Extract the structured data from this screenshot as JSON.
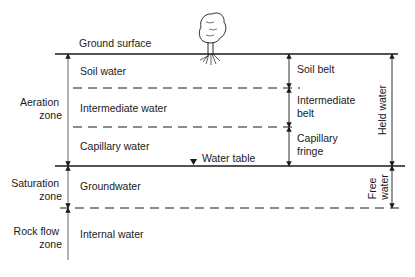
{
  "diagram": {
    "ground_surface": "Ground surface",
    "water_table": "Water table",
    "water_types": [
      {
        "label": "Soil water"
      },
      {
        "label": "Intermediate water"
      },
      {
        "label": "Capillary water"
      },
      {
        "label": "Groundwater"
      },
      {
        "label": "Internal water"
      }
    ],
    "zones": {
      "aeration": [
        "Aeration",
        "zone"
      ],
      "saturation": [
        "Saturation",
        "zone"
      ],
      "rock_flow": [
        "Rock flow",
        "zone"
      ]
    },
    "belts": {
      "soil": [
        "Soil belt"
      ],
      "intermediate": [
        "Intermediate",
        "belt"
      ],
      "capillary": [
        "Capillary",
        "fringe"
      ]
    },
    "water_classes": {
      "held": "Held water",
      "free": [
        "Free",
        "water"
      ]
    },
    "colors": {
      "line": "#1a1a1a",
      "axis": "#555555"
    }
  }
}
